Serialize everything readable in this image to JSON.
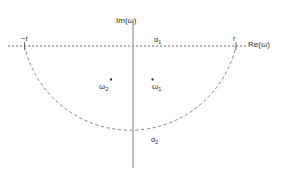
{
  "figure": {
    "type": "complex-plane-contour-diagram",
    "width": 286,
    "height": 176,
    "background_color": "#ffffff",
    "line_color": "#555555",
    "text_color": "#2b2b2b"
  },
  "axes": {
    "real": {
      "label": "Re(",
      "label_symbol": "ω",
      "label_close": ")",
      "label_full": "Re(ω)",
      "style": "dashed",
      "y": 46,
      "x_start": 8,
      "x_end": 246
    },
    "imaginary": {
      "label_full": "Im(ω)",
      "style": "solid",
      "x": 133,
      "y_start": 22,
      "y_end": 168
    }
  },
  "ticks": [
    {
      "name": "neg-r",
      "label": "−r",
      "x": -1.0
    },
    {
      "name": "pos-r",
      "label": "r",
      "x": 1.0
    }
  ],
  "contour": {
    "name": "semicircular-contour",
    "style": "dashed",
    "radius_px": 106,
    "center_x_px": 133,
    "center_y_px": 46,
    "orientation": "lower-half-plane",
    "segments": [
      {
        "name": "alpha1",
        "label": "α",
        "subscript": "1",
        "label_full": "α₁",
        "description": "real-axis segment from -r to r"
      },
      {
        "name": "alpha2",
        "label": "α",
        "subscript": "2",
        "label_full": "α₂",
        "description": "semicircular arc of radius r in lower half plane"
      }
    ]
  },
  "points": [
    {
      "name": "omega1",
      "label": "ω",
      "subscript": "1",
      "label_full": "ω₁",
      "marker_x_px": 152,
      "marker_y_px": 79,
      "dot_position": "above-left"
    },
    {
      "name": "omega2",
      "label": "ω",
      "subscript": "2",
      "label_full": "ω₂",
      "marker_x_px": 111,
      "marker_y_px": 79,
      "dot_position": "above-right"
    }
  ]
}
